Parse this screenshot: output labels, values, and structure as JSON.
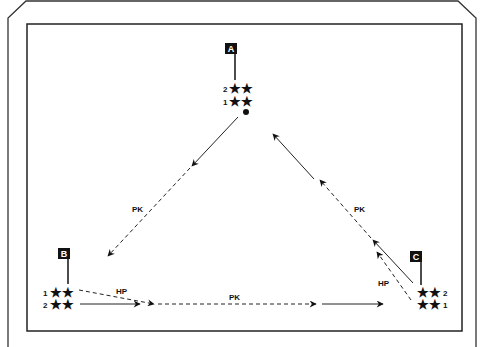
{
  "diagram": {
    "title": "",
    "players": {
      "A": {
        "label": "A",
        "rows": [
          {
            "num": "2",
            "stars": "★★"
          },
          {
            "num": "1",
            "stars": "★★"
          }
        ]
      },
      "B": {
        "label": "B",
        "rows": [
          {
            "num": "1",
            "stars": "★★"
          },
          {
            "num": "2",
            "stars": "★★"
          }
        ]
      },
      "C": {
        "label": "C",
        "rows": [
          {
            "num": "2",
            "stars": "★★"
          },
          {
            "num": "1",
            "stars": "★★"
          }
        ]
      }
    },
    "labels": {
      "pk_left": "PK",
      "pk_right": "PK",
      "pk_bottom": "PK",
      "hp_left": "HP",
      "hp_right": "HP"
    },
    "colors": {
      "line": "#111111",
      "frame": "#222222",
      "background": "#ffffff"
    }
  }
}
